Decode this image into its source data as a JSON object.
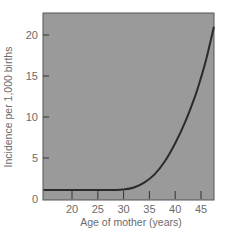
{
  "chart_data": {
    "type": "line",
    "title": "",
    "xlabel": "Age of mother (years)",
    "ylabel": "Incidence per 1,000 births",
    "xlim": [
      14.5,
      47.7
    ],
    "ylim": [
      0,
      22.5
    ],
    "xticks": [
      20,
      25,
      30,
      35,
      40,
      45
    ],
    "yticks": [
      0,
      5,
      10,
      15,
      20
    ],
    "grid": false,
    "legend": null,
    "plot_background": "#9a9a9a",
    "line_color": "#2b2b2b",
    "series": [
      {
        "name": "Incidence",
        "x": [
          14.5,
          20,
          25,
          28,
          30,
          32,
          34,
          36,
          38,
          40,
          42,
          44,
          45,
          46,
          47.5
        ],
        "y": [
          1.1,
          1.1,
          1.1,
          1.1,
          1.15,
          1.4,
          2.0,
          3.0,
          4.6,
          6.8,
          9.5,
          12.8,
          14.8,
          17.0,
          21.0
        ]
      }
    ]
  }
}
